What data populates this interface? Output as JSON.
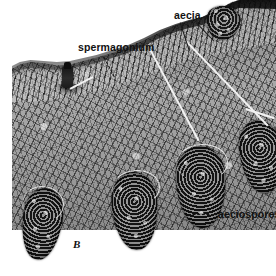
{
  "figure": {
    "panel_letter": "B",
    "background_color": "#ffffff",
    "ink_color": "#111111",
    "width": 276,
    "height": 276
  },
  "annotations": [
    {
      "id": "spermagonium",
      "label": "spermagonium",
      "leader_style": "dashed",
      "leader_color": "#141414"
    },
    {
      "id": "aecia",
      "label": "aecia",
      "leader_style": "solid",
      "leader_color": "#1a1a1a"
    },
    {
      "id": "aeciospores",
      "label": "aeciospores",
      "leader_style": "dashed",
      "leader_color": "#141414"
    }
  ],
  "structures": {
    "host_tissue": "sectioned host leaf tissue",
    "cuticle": "epidermal crust",
    "spermagonium": "spermagonium flask",
    "aecia_count": 5
  }
}
